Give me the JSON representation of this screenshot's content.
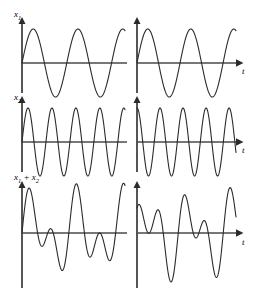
{
  "figure": {
    "title": "",
    "background_color": "#ffffff",
    "line_color": "#2b2b2b",
    "axis_color": "#4a4a4a",
    "width": 267,
    "height": 300
  },
  "labels": {
    "x1": "x",
    "x1_sub": "1",
    "x2": "x",
    "x2_sub": "2",
    "sum_a": "x",
    "sum_a_sub": "1",
    "sum_plus": " + ",
    "sum_b": "x",
    "sum_b_sub": "2",
    "t": "t"
  },
  "chart_data": {
    "type": "line",
    "xlabel": "t",
    "ylabel": "",
    "grid": false,
    "legend": "none",
    "layout": {
      "rows": 3,
      "cols": 2
    },
    "row_labels": [
      "x1",
      "x2",
      "x1 + x2"
    ],
    "column_labels": [
      "left",
      "right"
    ],
    "xlim": [
      0,
      1
    ],
    "ylim": [
      -2.2,
      2.2
    ],
    "panels": [
      {
        "id": "x1-left",
        "row": 0,
        "col": 0,
        "series_name": "x1",
        "waveform": "sine",
        "amplitude": 1,
        "cycles": 2.3,
        "phase_deg": 0,
        "ylim": [
          -1.2,
          1.2
        ]
      },
      {
        "id": "x1-right",
        "row": 0,
        "col": 1,
        "series_name": "x1",
        "waveform": "sine",
        "amplitude": 1,
        "cycles": 2.3,
        "phase_deg": 0,
        "ylim": [
          -1.2,
          1.2
        ]
      },
      {
        "id": "x2-left",
        "row": 1,
        "col": 0,
        "series_name": "x2",
        "waveform": "sine",
        "amplitude": 1,
        "cycles": 4.3,
        "phase_deg": 0,
        "ylim": [
          -1.2,
          1.2
        ]
      },
      {
        "id": "x2-right",
        "row": 1,
        "col": 1,
        "series_name": "x2",
        "waveform": "sine",
        "amplitude": 1,
        "cycles": 4.3,
        "phase_deg": 90,
        "ylim": [
          -1.2,
          1.2
        ]
      },
      {
        "id": "sum-left",
        "row": 2,
        "col": 0,
        "series_name": "x1 + x2",
        "waveform": "sum",
        "components": [
          {
            "amplitude": 1,
            "cycles": 2.3,
            "phase_deg": 0
          },
          {
            "amplitude": 1,
            "cycles": 4.3,
            "phase_deg": 0
          }
        ],
        "ylim": [
          -2.2,
          2.2
        ]
      },
      {
        "id": "sum-right",
        "row": 2,
        "col": 1,
        "series_name": "x1 + x2",
        "waveform": "sum",
        "components": [
          {
            "amplitude": 1,
            "cycles": 2.3,
            "phase_deg": 0
          },
          {
            "amplitude": 1,
            "cycles": 4.3,
            "phase_deg": 90
          }
        ],
        "ylim": [
          -2.2,
          2.2
        ]
      }
    ]
  }
}
